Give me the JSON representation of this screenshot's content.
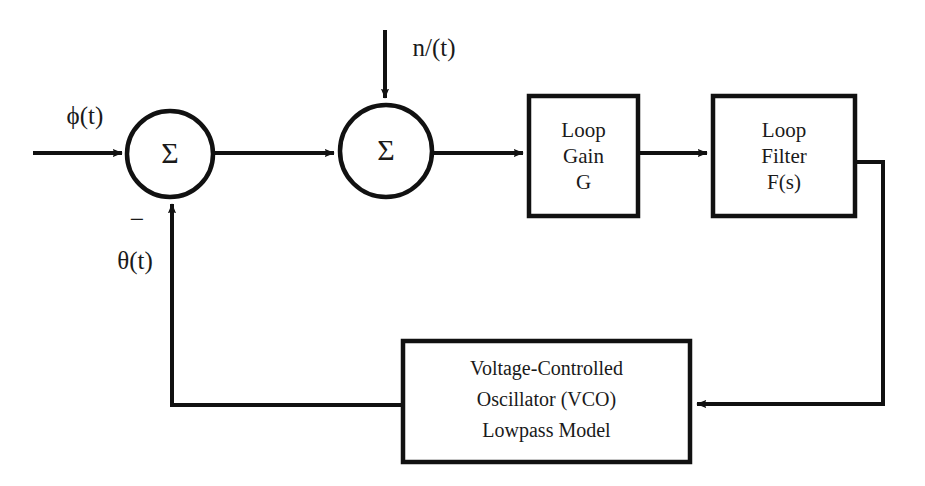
{
  "diagram": {
    "signals": {
      "input_phase": "ϕ(t)",
      "noise": "n/(t)",
      "feedback_phase": "θ(t)",
      "minus": "−"
    },
    "summers": [
      {
        "id": "phase-detector-summer",
        "symbol": "Σ"
      },
      {
        "id": "noise-summer",
        "symbol": "Σ"
      }
    ],
    "blocks": [
      {
        "id": "loop-gain-block",
        "lines": [
          "Loop",
          "Gain",
          "G"
        ]
      },
      {
        "id": "loop-filter-block",
        "lines": [
          "Loop",
          "Filter",
          "F(s)"
        ]
      },
      {
        "id": "vco-block",
        "lines": [
          "Voltage-Controlled",
          "Oscillator (VCO)",
          "Lowpass Model"
        ]
      }
    ],
    "colors": {
      "stroke": "#111111",
      "background": "#ffffff",
      "text": "#1a1a1a"
    }
  }
}
